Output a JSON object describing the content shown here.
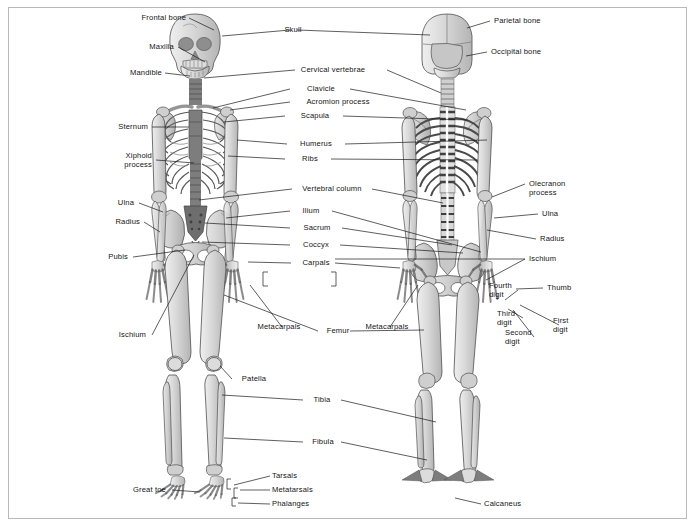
{
  "figure": {
    "background_color": "#ffffff",
    "border_color": "#b9b9b9",
    "label_color": "#141414",
    "leader_color": "#1a1a1a",
    "bone_fill": "#d4d4d4",
    "bone_fill_light": "#e3e3e3",
    "bone_fill_dark": "#9a9a9a",
    "bone_stroke": "#5a5a5a",
    "spine_fill": "#7d7d7d"
  },
  "views": {
    "anterior": {
      "name": "anterior-skeleton",
      "caption": ""
    },
    "posterior": {
      "name": "posterior-skeleton",
      "caption": ""
    }
  },
  "labels": {
    "left_column": [
      {
        "id": "frontal-bone",
        "text": "Frontal bone"
      },
      {
        "id": "maxilla",
        "text": "Maxilla"
      },
      {
        "id": "mandible",
        "text": "Mandible"
      },
      {
        "id": "sternum",
        "text": "Sternum"
      },
      {
        "id": "xiphoid-process",
        "text": "Xiphoid\nprocess"
      },
      {
        "id": "ulna-left",
        "text": "Ulna"
      },
      {
        "id": "radius-left",
        "text": "Radius"
      },
      {
        "id": "pubis",
        "text": "Pubis"
      },
      {
        "id": "ischium-left",
        "text": "Ischium"
      },
      {
        "id": "great-toe",
        "text": "Great toe"
      }
    ],
    "center_column": [
      {
        "id": "skull",
        "text": "Skull"
      },
      {
        "id": "cervical-vertebrae",
        "text": "Cervical vertebrae"
      },
      {
        "id": "clavicle",
        "text": "Clavicle"
      },
      {
        "id": "acromion-process",
        "text": "Acromion process"
      },
      {
        "id": "scapula",
        "text": "Scapula"
      },
      {
        "id": "humerus",
        "text": "Humerus"
      },
      {
        "id": "ribs",
        "text": "Ribs"
      },
      {
        "id": "vertebral-column",
        "text": "Vertebral column"
      },
      {
        "id": "ilium",
        "text": "Ilium"
      },
      {
        "id": "sacrum",
        "text": "Sacrum"
      },
      {
        "id": "coccyx",
        "text": "Coccyx"
      },
      {
        "id": "carpals",
        "text": "Carpals"
      },
      {
        "id": "metacarpals-left",
        "text": "Metacarpals"
      },
      {
        "id": "metacarpals-right",
        "text": "Metacarpals"
      },
      {
        "id": "femur",
        "text": "Femur"
      },
      {
        "id": "patella",
        "text": "Patella"
      },
      {
        "id": "tibia",
        "text": "Tibia"
      },
      {
        "id": "fibula",
        "text": "Fibula"
      },
      {
        "id": "tarsals",
        "text": "Tarsals"
      },
      {
        "id": "metatarsals",
        "text": "Metatarsals"
      },
      {
        "id": "phalanges",
        "text": "Phalanges"
      },
      {
        "id": "calcaneus",
        "text": "Calcaneus"
      }
    ],
    "right_column": [
      {
        "id": "parietal-bone",
        "text": "Parietal bone"
      },
      {
        "id": "occipital-bone",
        "text": "Occipital bone"
      },
      {
        "id": "olecranon-process",
        "text": "Olecranon\nprocess"
      },
      {
        "id": "ulna-right",
        "text": "Ulna"
      },
      {
        "id": "radius-right",
        "text": "Radius"
      },
      {
        "id": "ischium-right",
        "text": "Ischium"
      },
      {
        "id": "thumb",
        "text": "Thumb"
      },
      {
        "id": "fourth-digit",
        "text": "Fourth\ndigit"
      },
      {
        "id": "third-digit",
        "text": "Third\ndigit"
      },
      {
        "id": "second-digit",
        "text": "Second\ndigit"
      },
      {
        "id": "first-digit",
        "text": "First\ndigit"
      }
    ]
  }
}
